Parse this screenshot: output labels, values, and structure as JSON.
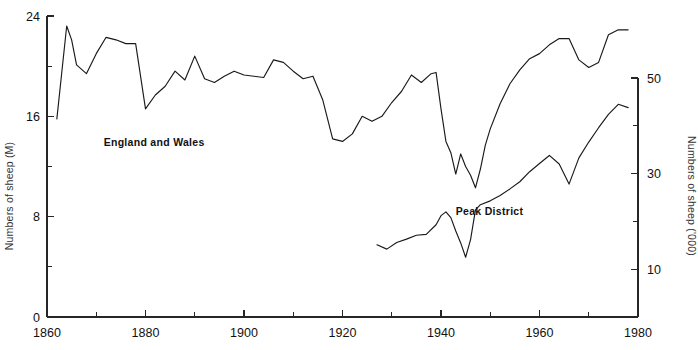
{
  "chart_data": {
    "type": "line",
    "title": "",
    "subtitle": "",
    "xlabel": "",
    "ylabel": "Numbers of sheep (M)",
    "y2label": "Numbers of sheep ('000)",
    "xlim": [
      1860,
      1980
    ],
    "ylim": [
      0,
      24
    ],
    "y2lim": [
      0,
      58.6
    ],
    "grid": false,
    "legend_position": "inline-annotation",
    "x_ticks_major": [
      1860,
      1880,
      1900,
      1920,
      1940,
      1960,
      1980
    ],
    "x_ticks_major_labels": [
      "1860",
      "1880",
      "1900",
      "1920",
      "1940",
      "1960",
      "1980"
    ],
    "x_ticks_minor": [
      1870,
      1890,
      1910,
      1930,
      1950,
      1970
    ],
    "y_ticks_major": [
      0,
      8,
      16,
      24
    ],
    "y_ticks_major_labels": [
      "0",
      "8",
      "16",
      "24"
    ],
    "y_ticks_minor": [
      4,
      12,
      20
    ],
    "y2_ticks_major": [
      10,
      30,
      50
    ],
    "y2_ticks_major_labels": [
      "10",
      "30",
      "50"
    ],
    "y2_ticks_minor": [
      20,
      40
    ],
    "annotations": [
      {
        "name": "england-and-wales-label",
        "text": "England and Wales",
        "x": 1871.5,
        "y": 13.6
      },
      {
        "name": "peak-district-label",
        "text": "Peak District",
        "x": 1943.0,
        "y": 8.1
      }
    ],
    "series": [
      {
        "name": "England and Wales",
        "axis": "left",
        "units": "millions",
        "x": [
          1862,
          1863,
          1864,
          1865,
          1866,
          1868,
          1870,
          1872,
          1874,
          1876,
          1878,
          1880,
          1882,
          1884,
          1886,
          1888,
          1890,
          1892,
          1894,
          1896,
          1898,
          1900,
          1902,
          1904,
          1906,
          1908,
          1910,
          1912,
          1914,
          1916,
          1918,
          1920,
          1922,
          1924,
          1926,
          1928,
          1930,
          1932,
          1934,
          1936,
          1938,
          1939,
          1940,
          1941,
          1942,
          1943,
          1944,
          1945,
          1946,
          1947,
          1948,
          1949,
          1950,
          1952,
          1954,
          1956,
          1958,
          1960,
          1962,
          1964,
          1966,
          1968,
          1970,
          1972,
          1974,
          1976,
          1978
        ],
        "y": [
          15.8,
          19.5,
          23.2,
          22.1,
          20.1,
          19.4,
          21.0,
          22.3,
          22.1,
          21.8,
          21.8,
          16.6,
          17.7,
          18.4,
          19.6,
          18.9,
          20.8,
          19.0,
          18.7,
          19.2,
          19.6,
          19.3,
          19.2,
          19.1,
          20.5,
          20.3,
          19.6,
          19.0,
          19.2,
          17.3,
          14.2,
          14.0,
          14.6,
          16.0,
          15.6,
          16.0,
          17.1,
          18.0,
          19.3,
          18.7,
          19.4,
          19.5,
          16.6,
          14.0,
          13.1,
          11.4,
          13.0,
          12.0,
          11.3,
          10.3,
          11.8,
          13.7,
          15.0,
          17.0,
          18.6,
          19.7,
          20.6,
          21.0,
          21.7,
          22.2,
          22.2,
          20.5,
          19.9,
          20.3,
          22.5,
          22.9,
          22.9
        ]
      },
      {
        "name": "Peak District",
        "axis": "right",
        "units": "thousands",
        "x": [
          1927,
          1929,
          1931,
          1933,
          1935,
          1937,
          1939,
          1940,
          1941,
          1942,
          1943,
          1944,
          1945,
          1946,
          1947,
          1948,
          1950,
          1952,
          1954,
          1956,
          1958,
          1960,
          1962,
          1964,
          1966,
          1968,
          1970,
          1972,
          1974,
          1976,
          1978
        ],
        "y": [
          15.1,
          14.2,
          15.6,
          16.3,
          17.1,
          17.3,
          19.3,
          21.2,
          22.0,
          20.8,
          18.0,
          15.5,
          12.5,
          16.2,
          22.4,
          23.5,
          24.3,
          25.4,
          26.8,
          28.3,
          30.4,
          32.1,
          33.8,
          32.0,
          27.8,
          33.3,
          36.6,
          39.6,
          42.4,
          44.5,
          43.8
        ]
      }
    ]
  },
  "plot_geometry": {
    "left_axis_x": 47,
    "right_axis_x": 638,
    "baseline_y": 317,
    "left_top_y": 16,
    "left_top_value": 24,
    "right_top_y": 78,
    "right_top_value": 50,
    "right_unit_px_per_10": 47.8
  }
}
